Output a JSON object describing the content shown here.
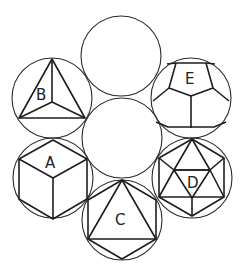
{
  "diagram": {
    "colors": {
      "stroke": "#1e1e1e",
      "face_light": "#f2f2f2",
      "face_dark": "#b8b8b8",
      "background": "#ffffff"
    },
    "center_circle": {
      "label": "",
      "fill": "#ffffff"
    },
    "sphere": {
      "label": ""
    },
    "solids": [
      {
        "id": "A",
        "label": "A",
        "name": "Cube"
      },
      {
        "id": "B",
        "label": "B",
        "name": "Tetrahedron"
      },
      {
        "id": "C",
        "label": "C",
        "name": "Octahedron"
      },
      {
        "id": "D",
        "label": "D",
        "name": "Icosahedron"
      },
      {
        "id": "E",
        "label": "E",
        "name": "Dodecahedron"
      }
    ]
  }
}
